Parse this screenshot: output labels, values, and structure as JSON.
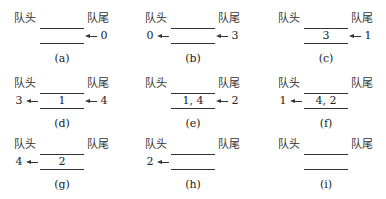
{
  "labels": {
    "head": "队头",
    "tail": "队尾"
  },
  "panels": [
    {
      "id": "a",
      "caption": "(a)",
      "content": "",
      "dequeued": "",
      "enqueued": "0"
    },
    {
      "id": "b",
      "caption": "(b)",
      "content": "",
      "dequeued": "0",
      "enqueued": "3"
    },
    {
      "id": "c",
      "caption": "(c)",
      "content": "3",
      "dequeued": "",
      "enqueued": "1"
    },
    {
      "id": "d",
      "caption": "(d)",
      "content": "1",
      "dequeued": "3",
      "enqueued": "4"
    },
    {
      "id": "e",
      "caption": "(e)",
      "content": "1, 4",
      "dequeued": "",
      "enqueued": "2"
    },
    {
      "id": "f",
      "caption": "(f)",
      "content": "4, 2",
      "dequeued": "1",
      "enqueued": ""
    },
    {
      "id": "g",
      "caption": "(g)",
      "content": "2",
      "dequeued": "4",
      "enqueued": ""
    },
    {
      "id": "h",
      "caption": "(h)",
      "content": "",
      "dequeued": "2",
      "enqueued": ""
    },
    {
      "id": "i",
      "caption": "(i)",
      "content": "",
      "dequeued": "",
      "enqueued": ""
    }
  ]
}
